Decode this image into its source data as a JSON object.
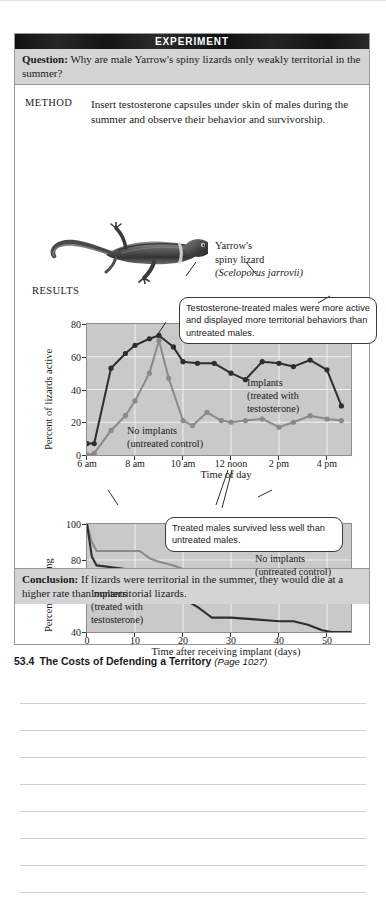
{
  "experiment": {
    "header_title": "EXPERIMENT",
    "question_label": "Question:",
    "question_text": " Why are male Yarrow's spiny lizards only weakly territorial in the summer?",
    "method_label": "METHOD",
    "method_text": "Insert testosterone capsules under skin of males during the summer and observe their behavior and survivorship.",
    "results_label": "RESULTS",
    "conclusion_label": "Conclusion:",
    "conclusion_text": " If lizards were territorial in the summer, they would die at a higher rate than nonterritorial lizards."
  },
  "organism": {
    "common_name_line1": "Yarrow's",
    "common_name_line2": "spiny lizard",
    "scientific_name": "(Sceloporus jarrovii)",
    "image_alt": "lizard-photo"
  },
  "callouts": [
    {
      "id": "callout-1",
      "text": "Testosterone-treated males were more active and displayed more territorial behaviors than untreated males."
    },
    {
      "id": "callout-2",
      "text": "Treated males survived less well than untreated males."
    }
  ],
  "figure_caption": {
    "number": "53.4",
    "title": "The Costs of Defending a Territory",
    "page_ref": "(Page 1027)"
  },
  "series_labels": {
    "implants_line1": "Implants",
    "implants_line2": "(treated with",
    "implants_line3": "testosterone)",
    "control_line1": "No implants",
    "control_line2": "(untreated control)"
  },
  "colors": {
    "plot_background": "#c9c9c9",
    "implant_series": "#2e2e2e",
    "control_series": "#8a8a8a",
    "band_background": "#1b1b1b",
    "panel_tint": "#d4d4d4",
    "gridline": "#f0f0f0"
  },
  "notes": {
    "line_count": 8
  },
  "chart_data": [
    {
      "type": "line",
      "id": "activity-chart",
      "title": "",
      "xlabel": "Time of day",
      "ylabel": "Percent of lizards active",
      "ylim": [
        0,
        80
      ],
      "yticks": [
        0,
        20,
        40,
        60,
        80
      ],
      "xlim": [
        6,
        17
      ],
      "xticks": [
        6,
        8,
        10,
        12,
        14,
        16
      ],
      "xticklabels": [
        "6 am",
        "8 am",
        "10 am",
        "12 noon",
        "2 pm",
        "4 pm"
      ],
      "grid": true,
      "legend": "inline-labels",
      "series": [
        {
          "name": "Implants (treated with testosterone)",
          "color": "#2e2e2e",
          "markers": true,
          "x": [
            6,
            6.3,
            7,
            7.6,
            8,
            8.6,
            9,
            9.6,
            10,
            10.6,
            11.3,
            12,
            12.6,
            13.3,
            14,
            14.6,
            15.3,
            16,
            16.6
          ],
          "y": [
            7,
            7,
            53,
            62,
            67,
            71,
            73,
            66,
            57,
            56,
            56,
            50,
            46,
            57,
            56,
            54,
            58,
            52,
            30
          ]
        },
        {
          "name": "No implants (untreated control)",
          "color": "#8a8a8a",
          "markers": true,
          "x": [
            6,
            6.3,
            7,
            7.6,
            8,
            8.6,
            9,
            9.4,
            10,
            10.4,
            11,
            11.6,
            12,
            12.6,
            13.3,
            14,
            14.6,
            15.3,
            16,
            16.6
          ],
          "y": [
            0,
            1,
            15,
            24,
            33,
            50,
            70,
            47,
            21,
            18,
            26,
            21,
            20,
            21,
            22,
            17,
            20,
            24,
            22,
            21
          ]
        }
      ]
    },
    {
      "type": "line",
      "id": "survivorship-chart",
      "title": "",
      "xlabel": "Time after receiving implant (days)",
      "ylabel": "Percent surviving",
      "ylim": [
        40,
        100
      ],
      "yticks": [
        40,
        60,
        80,
        100
      ],
      "xlim": [
        0,
        55
      ],
      "xticks": [
        0,
        10,
        20,
        30,
        40,
        50
      ],
      "xticklabels": [
        "0",
        "10",
        "20",
        "30",
        "40",
        "50"
      ],
      "grid": true,
      "legend": "inline-labels",
      "series": [
        {
          "name": "No implants (untreated control)",
          "color": "#8a8a8a",
          "markers": false,
          "x": [
            0,
            1,
            2,
            10,
            11,
            13,
            15,
            18,
            20,
            23,
            26,
            29,
            32,
            33,
            40,
            47,
            55
          ],
          "y": [
            100,
            90,
            85,
            85,
            85,
            81,
            79,
            77,
            75,
            73,
            70,
            67,
            65,
            64,
            64,
            64,
            64
          ]
        },
        {
          "name": "Implants (treated with testosterone)",
          "color": "#2e2e2e",
          "markers": false,
          "x": [
            0,
            1,
            2,
            8,
            11,
            12,
            14,
            16,
            18,
            21,
            23,
            25,
            26,
            30,
            35,
            40,
            43,
            46,
            49,
            51,
            55
          ],
          "y": [
            100,
            82,
            77,
            75,
            73,
            72,
            66,
            61,
            59,
            57,
            54,
            50,
            48,
            48,
            47,
            46,
            46,
            44,
            41,
            40,
            40
          ]
        }
      ]
    }
  ]
}
